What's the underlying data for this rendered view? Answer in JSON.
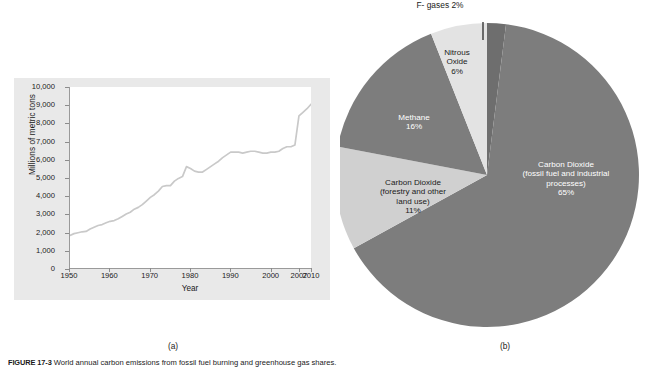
{
  "figure": {
    "caption_label": "FIGURE 17-3",
    "caption_text": "World annual carbon emissions from fossil fuel burning and greenhouse gas shares.",
    "panel_a_caption": "(a)",
    "panel_b_caption": "(b)"
  },
  "chart_data": [
    {
      "type": "line",
      "title": "",
      "xlabel": "Year",
      "ylabel": "Millions of metric tons",
      "xlim": [
        1950,
        2010
      ],
      "ylim": [
        0,
        10000
      ],
      "grid": false,
      "legend": "none",
      "xticklabels": [
        "1950",
        "1960",
        "1970",
        "1980",
        "1990",
        "2000",
        "2007",
        "2010"
      ],
      "xtickvalues": [
        1950,
        1960,
        1970,
        1980,
        1990,
        2000,
        2007,
        2010
      ],
      "yticklabels": [
        "0",
        "1,000",
        "2,000",
        "3,000",
        "4,000",
        "5,000",
        "6,000",
        "7,000",
        "8,000",
        "9,000",
        "10,000"
      ],
      "ytickvalues": [
        0,
        1000,
        2000,
        3000,
        4000,
        5000,
        6000,
        7000,
        8000,
        9000,
        10000
      ],
      "line_color": "#c9c9c9",
      "x": [
        1950,
        1951,
        1952,
        1953,
        1954,
        1955,
        1956,
        1957,
        1958,
        1959,
        1960,
        1961,
        1962,
        1963,
        1964,
        1965,
        1966,
        1967,
        1968,
        1969,
        1970,
        1971,
        1972,
        1973,
        1974,
        1975,
        1976,
        1977,
        1978,
        1979,
        1980,
        1981,
        1982,
        1983,
        1984,
        1985,
        1986,
        1987,
        1988,
        1989,
        1990,
        1991,
        1992,
        1993,
        1994,
        1995,
        1996,
        1997,
        1998,
        1999,
        2000,
        2001,
        2002,
        2003,
        2004,
        2005,
        2006,
        2007,
        2008,
        2009,
        2010
      ],
      "values": [
        1800,
        1900,
        1950,
        2000,
        2020,
        2150,
        2250,
        2350,
        2400,
        2500,
        2580,
        2620,
        2720,
        2850,
        2980,
        3080,
        3250,
        3350,
        3500,
        3700,
        3900,
        4050,
        4250,
        4500,
        4550,
        4550,
        4800,
        4950,
        5050,
        5600,
        5500,
        5350,
        5300,
        5300,
        5450,
        5600,
        5750,
        5900,
        6100,
        6250,
        6400,
        6400,
        6400,
        6350,
        6400,
        6450,
        6450,
        6400,
        6350,
        6350,
        6400,
        6400,
        6450,
        6600,
        6700,
        6700,
        6800,
        8400,
        8600,
        8800,
        9050
      ]
    },
    {
      "type": "pie",
      "title": "",
      "legend": "labels-on-slices",
      "labels": [
        "Carbon Dioxide (fossil fuel and industrial processes)",
        "Carbon Dioxide (forestry and other land use)",
        "Methane",
        "Nitrous Oxide",
        "F- gases"
      ],
      "values": [
        65,
        11,
        16,
        6,
        2
      ],
      "colors": [
        "#7d7d7d",
        "#d0d0d0",
        "#7d7d7d",
        "#e3e3e3",
        "#6e6e6e"
      ]
    }
  ],
  "panel_a": {
    "y_axis_title": "Millions of metric tons",
    "x_axis_title": "Year",
    "yticks": [
      "10,000",
      "9,000",
      "8,000",
      "7,000",
      "6,000",
      "5,000",
      "4,000",
      "3,000",
      "2,000",
      "1,000",
      "0"
    ],
    "xticks": [
      "1950",
      "1960",
      "1970",
      "1980",
      "1990",
      "2000",
      "2007",
      "2010"
    ]
  },
  "panel_b": {
    "slices": {
      "co2_fossil": {
        "line1": "Carbon Dioxide",
        "line2": "(fossil fuel and industrial",
        "line3": "processes)",
        "percent": "65%"
      },
      "co2_forestry": {
        "line1": "Carbon Dioxide",
        "line2": "(forestry and other",
        "line3": "land use)",
        "percent": "11%"
      },
      "methane": {
        "line1": "Methane",
        "percent": "16%"
      },
      "nitrous_oxide": {
        "line1": "Nitrous",
        "line2": "Oxide",
        "percent": "6%"
      },
      "fgases": {
        "label": "F- gases 2%"
      }
    }
  }
}
